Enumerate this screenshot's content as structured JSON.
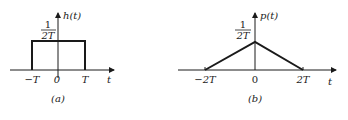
{
  "panel_a": {
    "caption": "(a)",
    "ylabel": "h(t)",
    "xlabel": "t",
    "height_num": "1",
    "height_den": "2T",
    "ticks": [
      "−T",
      "0",
      "T"
    ],
    "shape": "rectangle",
    "support": [
      -1,
      1
    ],
    "height": "1/(2T)"
  },
  "panel_b": {
    "caption": "(b)",
    "ylabel": "p(t)",
    "xlabel": "t",
    "height_num": "1",
    "height_den": "2T",
    "ticks": [
      "−2T",
      "0",
      "2T"
    ],
    "shape": "triangle",
    "support": [
      -2,
      2
    ],
    "height": "1/(2T)"
  },
  "colors": {
    "stroke": "#1a1a1a",
    "background": "#ffffff"
  }
}
